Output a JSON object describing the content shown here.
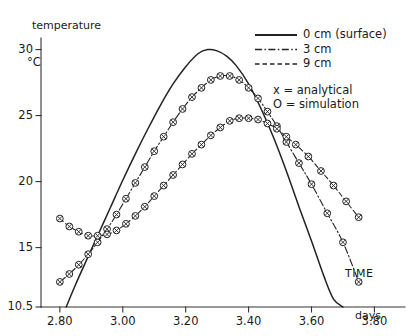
{
  "chart_data": {
    "type": "line",
    "title": "",
    "ylabel_top": "temperature",
    "ylabel_unit": "°C",
    "xlabel": "TIME",
    "xunit": "days",
    "xlim": [
      2.74,
      3.84
    ],
    "ylim": [
      10.5,
      30.8
    ],
    "grid": false,
    "xticks": [
      2.8,
      3.0,
      3.2,
      3.4,
      3.6,
      3.8
    ],
    "xticklabels": [
      "2.80",
      "3.00",
      "3.20",
      "3.40",
      "3.60",
      "3.80"
    ],
    "yticks": [
      10.5,
      15,
      20,
      25,
      30
    ],
    "yticklabels": [
      "10.5",
      "15",
      "20",
      "25",
      "30"
    ],
    "legend_position": "upper-right",
    "marker_note": "circles with x inside (analytical x overlaid on simulation O)",
    "series": [
      {
        "name": "0 cm (surface)",
        "style": "solid",
        "markers": false,
        "x": [
          2.82,
          2.85,
          2.88,
          2.92,
          2.96,
          3.0,
          3.04,
          3.08,
          3.12,
          3.16,
          3.2,
          3.24,
          3.27,
          3.3,
          3.33,
          3.36,
          3.4,
          3.44,
          3.48,
          3.52,
          3.56,
          3.6,
          3.64,
          3.67,
          3.7
        ],
        "y": [
          10.5,
          12.2,
          13.8,
          15.9,
          18.0,
          20.1,
          22.1,
          24.0,
          25.8,
          27.4,
          28.7,
          29.7,
          30.0,
          29.9,
          29.5,
          28.8,
          27.4,
          25.5,
          23.3,
          20.8,
          18.1,
          15.5,
          12.8,
          11.1,
          10.5
        ]
      },
      {
        "name": "3 cm",
        "style": "dashdot",
        "markers": true,
        "x": [
          2.8,
          2.83,
          2.86,
          2.89,
          2.92,
          2.95,
          2.98,
          3.01,
          3.04,
          3.07,
          3.1,
          3.13,
          3.16,
          3.19,
          3.22,
          3.25,
          3.28,
          3.31,
          3.34,
          3.37,
          3.4,
          3.43,
          3.46,
          3.49,
          3.52,
          3.56,
          3.6,
          3.65,
          3.7,
          3.75
        ],
        "y": [
          12.4,
          13.0,
          13.7,
          14.5,
          15.4,
          16.4,
          17.5,
          18.7,
          19.9,
          21.1,
          22.3,
          23.4,
          24.5,
          25.5,
          26.4,
          27.1,
          27.7,
          28.0,
          28.0,
          27.7,
          27.1,
          26.3,
          25.3,
          24.2,
          23.0,
          21.4,
          19.8,
          17.6,
          15.4,
          12.4
        ]
      },
      {
        "name": "9 cm",
        "style": "dashed",
        "markers": true,
        "x": [
          2.8,
          2.83,
          2.86,
          2.89,
          2.92,
          2.95,
          2.98,
          3.01,
          3.04,
          3.07,
          3.1,
          3.13,
          3.16,
          3.19,
          3.22,
          3.25,
          3.28,
          3.31,
          3.34,
          3.37,
          3.4,
          3.43,
          3.46,
          3.49,
          3.52,
          3.55,
          3.59,
          3.63,
          3.67,
          3.71,
          3.75
        ],
        "y": [
          17.2,
          16.6,
          16.2,
          15.9,
          15.9,
          16.0,
          16.3,
          16.8,
          17.4,
          18.1,
          18.9,
          19.7,
          20.5,
          21.3,
          22.1,
          22.8,
          23.5,
          24.1,
          24.6,
          24.8,
          24.8,
          24.7,
          24.4,
          24.0,
          23.4,
          22.8,
          21.9,
          20.8,
          19.7,
          18.5,
          17.3
        ]
      }
    ],
    "legend": [
      {
        "label": "0 cm (surface)",
        "style": "solid"
      },
      {
        "label": "3 cm",
        "style": "dashdot"
      },
      {
        "label": "9 cm",
        "style": "dashed"
      }
    ],
    "marker_legend": [
      {
        "symbol": "x",
        "equals": "=",
        "label": "analytical"
      },
      {
        "symbol": "O",
        "equals": "=",
        "label": "simulation"
      }
    ]
  }
}
